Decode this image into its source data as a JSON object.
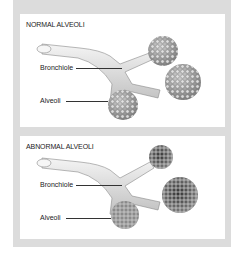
{
  "panels": [
    {
      "title": "NORMAL ALVEOLI",
      "labels": {
        "bronchiole": "Bronchiole",
        "alveoli": "Alveoli"
      },
      "state": "normal"
    },
    {
      "title": "ABNORMAL ALVEOLI",
      "labels": {
        "bronchiole": "Bronchiole",
        "alveoli": "Alveoli"
      },
      "state": "abnormal"
    }
  ],
  "colors": {
    "frame": "#dcdcdc",
    "panel": "#ffffff",
    "text": "#222222",
    "tube": "#e6e6e6",
    "alveoli_normal": "#9a9a9a",
    "alveoli_abnormal": "#555555"
  }
}
